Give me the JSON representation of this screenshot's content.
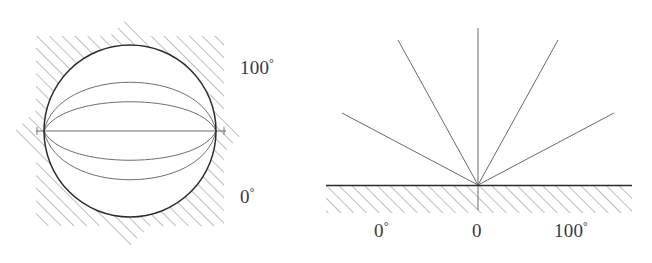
{
  "figure": {
    "background_color": "#ffffff",
    "ink_color": "#555555",
    "outline_color": "#2b2b2b",
    "hatch_color": "#8a8a8a",
    "label_color": "#3a3a3a"
  },
  "left_panel": {
    "name": "sphere-disk-model",
    "shape": "circle",
    "center": [
      130,
      131
    ],
    "radius": 86,
    "meridian_arc_count": 5,
    "has_horizontal_axis": true,
    "hatching": {
      "angle_degrees": 45,
      "direction": "forward-slash",
      "region": "outside-circle"
    },
    "labels": {
      "top": "100",
      "top_degree": "°",
      "bottom": "0",
      "bottom_degree": "°"
    }
  },
  "right_panel": {
    "name": "half-plane-model",
    "baseline_y": 185,
    "origin_x": 478,
    "ray_count": 5,
    "ray_angles_degrees": [
      28,
      56,
      90,
      124,
      152
    ],
    "has_downward_stub": true,
    "hatching": {
      "angle_degrees": 45,
      "direction": "forward-slash",
      "region": "below-baseline"
    },
    "axis_labels": [
      {
        "text": "0",
        "degree": "°",
        "x": 383
      },
      {
        "text": "0",
        "degree": "",
        "x": 478
      },
      {
        "text": "100",
        "degree": "°",
        "x": 573
      }
    ]
  }
}
